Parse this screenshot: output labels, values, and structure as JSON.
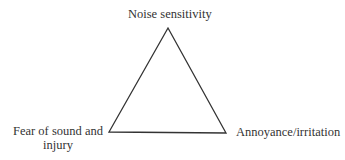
{
  "diagram": {
    "type": "triangle",
    "vertices": {
      "top": {
        "label": "Noise sensitivity"
      },
      "bottom_left": {
        "label_line1": "Fear of sound and",
        "label_line2": "injury"
      },
      "bottom_right": {
        "label": "Annoyance/irritation"
      }
    },
    "colors": {
      "stroke": "#333333",
      "text": "#333333",
      "background": "#ffffff"
    }
  }
}
